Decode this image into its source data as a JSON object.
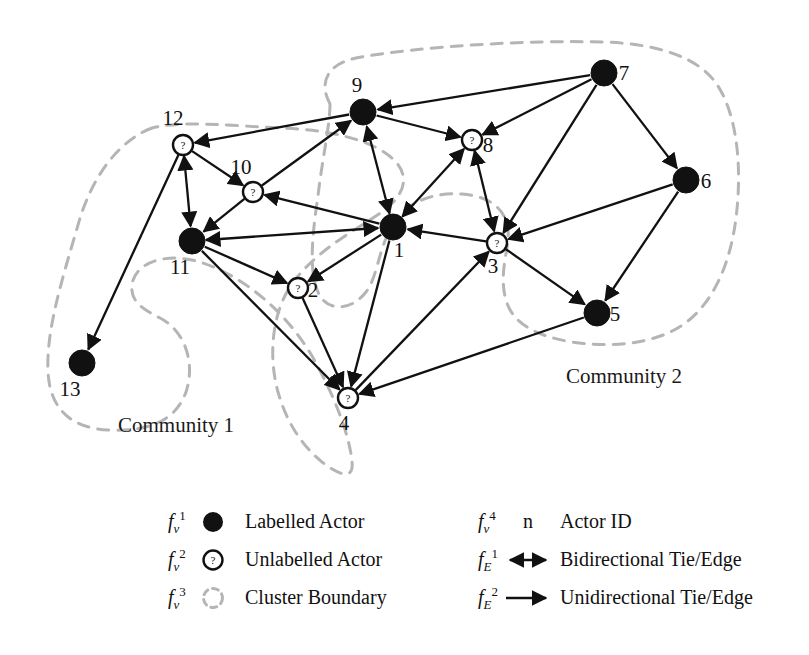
{
  "figure": {
    "colors": {
      "labelled_actor_fill": "#111111",
      "unlabelled_actor_fill": "#ffffff",
      "unlabelled_actor_stroke": "#111111",
      "edge": "#111111",
      "cluster_boundary": "#b5b5b5",
      "background": "#ffffff"
    }
  },
  "graph": {
    "nodes": [
      {
        "id": "1",
        "label": "1",
        "type": "labelled",
        "x": 393,
        "y": 227,
        "label_dx": 6,
        "label_dy": 30,
        "r": 13
      },
      {
        "id": "2",
        "label": "2",
        "type": "unlabelled",
        "x": 298,
        "y": 288,
        "label_dx": 15,
        "label_dy": 9,
        "r": 10
      },
      {
        "id": "3",
        "label": "3",
        "type": "unlabelled",
        "x": 497,
        "y": 243,
        "label_dx": -4,
        "label_dy": 30,
        "r": 10
      },
      {
        "id": "4",
        "label": "4",
        "type": "unlabelled",
        "x": 348,
        "y": 398,
        "label_dx": -4,
        "label_dy": 32,
        "r": 10
      },
      {
        "id": "5",
        "label": "5",
        "type": "labelled",
        "x": 597,
        "y": 313,
        "label_dx": 18,
        "label_dy": 8,
        "r": 13
      },
      {
        "id": "6",
        "label": "6",
        "type": "labelled",
        "x": 686,
        "y": 180,
        "label_dx": 20,
        "label_dy": 8,
        "r": 13
      },
      {
        "id": "7",
        "label": "7",
        "type": "labelled",
        "x": 604,
        "y": 73,
        "label_dx": 20,
        "label_dy": 7,
        "r": 13
      },
      {
        "id": "8",
        "label": "8",
        "type": "unlabelled",
        "x": 472,
        "y": 140,
        "label_dx": 16,
        "label_dy": 12,
        "r": 10
      },
      {
        "id": "9",
        "label": "9",
        "type": "labelled",
        "x": 363,
        "y": 112,
        "label_dx": -6,
        "label_dy": -20,
        "r": 13
      },
      {
        "id": "10",
        "label": "10",
        "type": "unlabelled",
        "x": 253,
        "y": 192,
        "label_dx": -12,
        "label_dy": -18,
        "r": 10
      },
      {
        "id": "11",
        "label": "11",
        "type": "labelled",
        "x": 192,
        "y": 241,
        "label_dx": -12,
        "label_dy": 33,
        "r": 13
      },
      {
        "id": "12",
        "label": "12",
        "type": "unlabelled",
        "x": 183,
        "y": 145,
        "label_dx": -10,
        "label_dy": -20,
        "r": 10
      },
      {
        "id": "13",
        "label": "13",
        "type": "labelled",
        "x": 82,
        "y": 363,
        "label_dx": -12,
        "label_dy": 33,
        "r": 13
      }
    ],
    "edges": [
      {
        "from": "9",
        "to": "12",
        "dir": "uni"
      },
      {
        "from": "12",
        "to": "10",
        "dir": "uni"
      },
      {
        "from": "12",
        "to": "11",
        "dir": "uni"
      },
      {
        "from": "11",
        "to": "12",
        "dir": "uni"
      },
      {
        "from": "12",
        "to": "13",
        "dir": "uni"
      },
      {
        "from": "10",
        "to": "11",
        "dir": "uni"
      },
      {
        "from": "10",
        "to": "9",
        "dir": "uni"
      },
      {
        "from": "1",
        "to": "10",
        "dir": "uni"
      },
      {
        "from": "11",
        "to": "1",
        "dir": "bi"
      },
      {
        "from": "11",
        "to": "2",
        "dir": "uni"
      },
      {
        "from": "11",
        "to": "4",
        "dir": "uni"
      },
      {
        "from": "1",
        "to": "2",
        "dir": "uni"
      },
      {
        "from": "2",
        "to": "4",
        "dir": "uni"
      },
      {
        "from": "1",
        "to": "4",
        "dir": "uni"
      },
      {
        "from": "1",
        "to": "9",
        "dir": "uni"
      },
      {
        "from": "9",
        "to": "1",
        "dir": "uni"
      },
      {
        "from": "9",
        "to": "8",
        "dir": "uni"
      },
      {
        "from": "1",
        "to": "8",
        "dir": "uni"
      },
      {
        "from": "8",
        "to": "1",
        "dir": "uni"
      },
      {
        "from": "8",
        "to": "3",
        "dir": "uni"
      },
      {
        "from": "3",
        "to": "8",
        "dir": "uni"
      },
      {
        "from": "3",
        "to": "1",
        "dir": "uni"
      },
      {
        "from": "7",
        "to": "9",
        "dir": "uni"
      },
      {
        "from": "7",
        "to": "8",
        "dir": "uni"
      },
      {
        "from": "7",
        "to": "3",
        "dir": "uni"
      },
      {
        "from": "7",
        "to": "6",
        "dir": "uni"
      },
      {
        "from": "6",
        "to": "3",
        "dir": "uni"
      },
      {
        "from": "6",
        "to": "5",
        "dir": "uni"
      },
      {
        "from": "3",
        "to": "5",
        "dir": "uni"
      },
      {
        "from": "4",
        "to": "3",
        "dir": "uni"
      },
      {
        "from": "5",
        "to": "4",
        "dir": "uni"
      }
    ],
    "communities": [
      {
        "id": "community-1",
        "label": "Community 1",
        "label_x": 118,
        "label_y": 432
      },
      {
        "id": "community-2",
        "label": "Community 2",
        "label_x": 566,
        "label_y": 383
      }
    ]
  },
  "legend": {
    "items": [
      {
        "key": "labelled-actor",
        "sym_base": "f",
        "sym_sub": "v",
        "sym_sup": "1",
        "glyph": "filled-circle",
        "text": "Labelled Actor"
      },
      {
        "key": "unlabelled-actor",
        "sym_base": "f",
        "sym_sub": "v",
        "sym_sup": "2",
        "glyph": "question-circle",
        "text": "Unlabelled Actor"
      },
      {
        "key": "cluster-boundary",
        "sym_base": "f",
        "sym_sub": "v",
        "sym_sup": "3",
        "glyph": "dashed-circle",
        "text": "Cluster Boundary"
      },
      {
        "key": "actor-id",
        "sym_base": "f",
        "sym_sub": "v",
        "sym_sup": "4",
        "glyph": "n-letter",
        "text": "Actor ID"
      },
      {
        "key": "bidirectional-edge",
        "sym_base": "f",
        "sym_sub": "E",
        "sym_sup": "1",
        "glyph": "double-arrow",
        "text": "Bidirectional Tie/Edge"
      },
      {
        "key": "unidirectional-edge",
        "sym_base": "f",
        "sym_sub": "E",
        "sym_sup": "2",
        "glyph": "single-arrow",
        "text": "Unidirectional Tie/Edge"
      }
    ],
    "actor_id_glyph_text": "n"
  }
}
